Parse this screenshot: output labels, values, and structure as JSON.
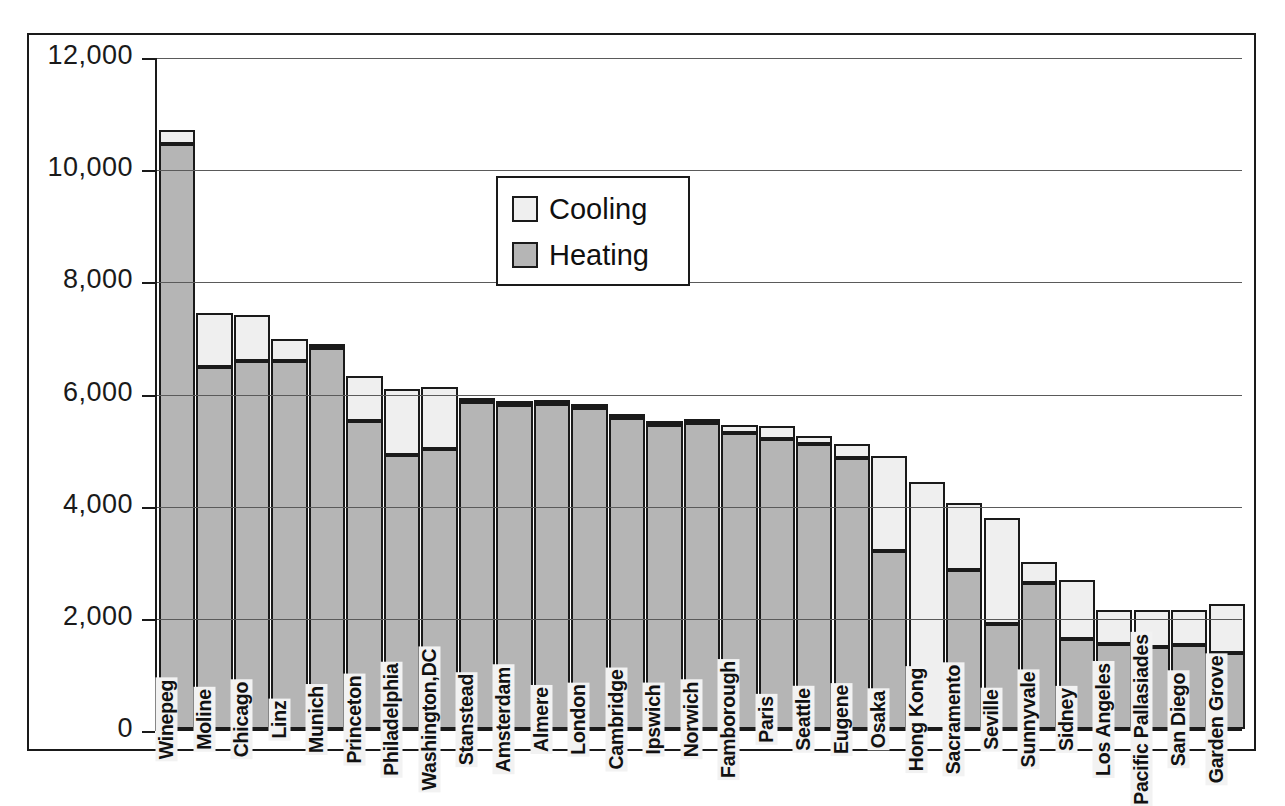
{
  "chart_data": {
    "type": "bar",
    "subtype": "stacked-bar",
    "title": "",
    "xlabel": "",
    "ylabel": "",
    "ylim": [
      0,
      12000
    ],
    "ytick_labels": [
      "0",
      "2,000",
      "4,000",
      "6,000",
      "8,000",
      "10,000",
      "12,000"
    ],
    "ytick_values": [
      0,
      2000,
      4000,
      6000,
      8000,
      10000,
      12000
    ],
    "grid": true,
    "grid_axis": "y",
    "legend": {
      "position": "upper-center",
      "entries": [
        {
          "name": "Cooling",
          "color": "#efefef"
        },
        {
          "name": "Heating",
          "color": "#b5b5b5"
        }
      ]
    },
    "categories": [
      "Winepeg",
      "Moline",
      "Chicago",
      "Linz",
      "Munich",
      "Princeton",
      "Philadelphia",
      "Washington,DC",
      "Stanstead",
      "Amsterdam",
      "Almere",
      "London",
      "Cambridge",
      "Ipswich",
      "Norwich",
      "Famborough",
      "Paris",
      "Seattle",
      "Eugene",
      "Osaka",
      "Hong Kong",
      "Sacramento",
      "Seville",
      "Sunnyvale",
      "Sidney",
      "Los Angeles",
      "Pacific Pallasiades",
      "San Diego",
      "Garden Grove"
    ],
    "series": [
      {
        "name": "Heating",
        "color": "#b5b5b5",
        "values": [
          10430,
          6450,
          6570,
          6570,
          6790,
          5500,
          4880,
          4990,
          5830,
          5780,
          5800,
          5720,
          5550,
          5420,
          5450,
          5280,
          5180,
          5080,
          4830,
          3180,
          0,
          2830,
          1870,
          2600,
          1600,
          1510,
          1460,
          1490,
          1350
        ]
      },
      {
        "name": "Cooling",
        "color": "#efefef",
        "values": [
          250,
          960,
          820,
          380,
          70,
          800,
          1180,
          1110,
          50,
          40,
          30,
          40,
          30,
          30,
          10,
          140,
          220,
          140,
          260,
          1680,
          4400,
          1200,
          1900,
          380,
          1060,
          620,
          660,
          640,
          880
        ]
      }
    ],
    "totals": [
      10680,
      7410,
      7390,
      6950,
      6860,
      6300,
      6060,
      6100,
      5880,
      5820,
      5830,
      5760,
      5580,
      5450,
      5460,
      5420,
      5400,
      5220,
      5090,
      4860,
      4400,
      4030,
      3770,
      2980,
      2660,
      2130,
      2120,
      2130,
      2230
    ]
  },
  "legend": {
    "cooling_label": "Cooling",
    "heating_label": "Heating"
  }
}
